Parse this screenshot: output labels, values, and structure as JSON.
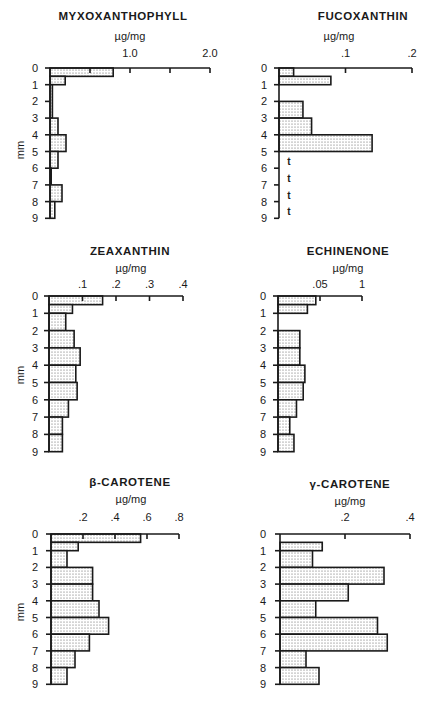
{
  "chart_data": [
    {
      "type": "bar",
      "orientation": "horizontal",
      "title": "MYXOXANTHOPHYLL",
      "xlabel": "µg/mg",
      "ylabel": "mm",
      "xlim": [
        0,
        2.0
      ],
      "x_ticks": [
        0.5,
        1.0,
        1.5,
        2.0
      ],
      "x_tick_labels": [
        {
          "value": 1.0,
          "label": "1.0"
        },
        {
          "value": 2.0,
          "label": "2.0"
        }
      ],
      "y_tick_labels": [
        "0",
        "1",
        "2",
        "3",
        "4",
        "5",
        "6",
        "7",
        "8",
        "9"
      ],
      "ylim": [
        0,
        9
      ],
      "bars": [
        {
          "from": 0,
          "to": 0.5,
          "value": 0.79
        },
        {
          "from": 0.5,
          "to": 1,
          "value": 0.19
        },
        {
          "from": 1,
          "to": 3,
          "value": 0.03
        },
        {
          "from": 3,
          "to": 4,
          "value": 0.1
        },
        {
          "from": 4,
          "to": 5,
          "value": 0.2
        },
        {
          "from": 5,
          "to": 6,
          "value": 0.1
        },
        {
          "from": 6,
          "to": 7,
          "value": 0.01
        },
        {
          "from": 7,
          "to": 8,
          "value": 0.15
        },
        {
          "from": 8,
          "to": 9,
          "value": 0.06
        }
      ],
      "trace": []
    },
    {
      "type": "bar",
      "orientation": "horizontal",
      "title": "FUCOXANTHIN",
      "xlabel": "µg/mg",
      "ylabel": "",
      "xlim": [
        0,
        0.2
      ],
      "x_ticks": [
        0.1,
        0.2
      ],
      "x_tick_labels": [
        {
          "value": 0.1,
          "label": ".1"
        },
        {
          "value": 0.2,
          "label": ".2"
        }
      ],
      "y_tick_labels": [
        "0",
        "1",
        "2",
        "3",
        "4",
        "5",
        "6",
        "7",
        "8",
        "9"
      ],
      "ylim": [
        0,
        9
      ],
      "bars": [
        {
          "from": 0,
          "to": 0.5,
          "value": 0.022
        },
        {
          "from": 0.5,
          "to": 1,
          "value": 0.078
        },
        {
          "from": 2,
          "to": 3,
          "value": 0.036
        },
        {
          "from": 3,
          "to": 4,
          "value": 0.049
        },
        {
          "from": 4,
          "to": 5,
          "value": 0.14
        }
      ],
      "trace": [
        {
          "depth": 6,
          "label": "t"
        },
        {
          "depth": 7,
          "label": "t"
        },
        {
          "depth": 8,
          "label": "t"
        },
        {
          "depth": 9,
          "label": "t"
        }
      ]
    },
    {
      "type": "bar",
      "orientation": "horizontal",
      "title": "ZEAXANTHIN",
      "xlabel": "µg/mg",
      "ylabel": "mm",
      "xlim": [
        0,
        0.4
      ],
      "x_ticks": [
        0.1,
        0.2,
        0.3,
        0.4
      ],
      "x_tick_labels": [
        {
          "value": 0.1,
          "label": ".1"
        },
        {
          "value": 0.2,
          "label": ".2"
        },
        {
          "value": 0.3,
          "label": ".3"
        },
        {
          "value": 0.4,
          "label": ".4"
        }
      ],
      "y_tick_labels": [
        "0",
        "1",
        "2",
        "3",
        "4",
        "5",
        "6",
        "7",
        "8",
        "9"
      ],
      "ylim": [
        0,
        9
      ],
      "bars": [
        {
          "from": 0,
          "to": 0.5,
          "value": 0.16
        },
        {
          "from": 0.5,
          "to": 1,
          "value": 0.07
        },
        {
          "from": 1,
          "to": 2,
          "value": 0.05
        },
        {
          "from": 2,
          "to": 3,
          "value": 0.075
        },
        {
          "from": 3,
          "to": 4,
          "value": 0.093
        },
        {
          "from": 4,
          "to": 5,
          "value": 0.08
        },
        {
          "from": 5,
          "to": 6,
          "value": 0.084
        },
        {
          "from": 6,
          "to": 7,
          "value": 0.058
        },
        {
          "from": 7,
          "to": 8,
          "value": 0.04
        },
        {
          "from": 8,
          "to": 9,
          "value": 0.04
        }
      ],
      "trace": []
    },
    {
      "type": "bar",
      "orientation": "horizontal",
      "title": "ECHINENONE",
      "xlabel": "µg/mg",
      "ylabel": "",
      "xlim": [
        0,
        0.1
      ],
      "x_ticks": [
        0.05,
        0.1
      ],
      "x_tick_labels": [
        {
          "value": 0.05,
          "label": ".05"
        },
        {
          "value": 0.1,
          "label": "1"
        }
      ],
      "y_tick_labels": [
        "0",
        "1",
        "2",
        "3",
        "4",
        "5",
        "6",
        "7",
        "8",
        "9"
      ],
      "ylim": [
        0,
        9
      ],
      "bars": [
        {
          "from": 0,
          "to": 0.5,
          "value": 0.045
        },
        {
          "from": 0.5,
          "to": 1,
          "value": 0.035
        },
        {
          "from": 2,
          "to": 3,
          "value": 0.026
        },
        {
          "from": 3,
          "to": 4,
          "value": 0.026
        },
        {
          "from": 4,
          "to": 5,
          "value": 0.032
        },
        {
          "from": 5,
          "to": 6,
          "value": 0.03
        },
        {
          "from": 6,
          "to": 7,
          "value": 0.022
        },
        {
          "from": 7,
          "to": 8,
          "value": 0.014
        },
        {
          "from": 8,
          "to": 9,
          "value": 0.019
        }
      ],
      "trace": []
    },
    {
      "type": "bar",
      "orientation": "horizontal",
      "title": "β-CAROTENE",
      "xlabel": "µg/mg",
      "ylabel": "mm",
      "xlim": [
        0,
        0.8
      ],
      "x_ticks": [
        0.2,
        0.4,
        0.6,
        0.8
      ],
      "x_tick_labels": [
        {
          "value": 0.2,
          "label": ".2"
        },
        {
          "value": 0.4,
          "label": ".4"
        },
        {
          "value": 0.6,
          "label": ".6"
        },
        {
          "value": 0.8,
          "label": ".8"
        }
      ],
      "y_tick_labels": [
        "0",
        "1",
        "2",
        "3",
        "4",
        "5",
        "6",
        "7",
        "8",
        "9"
      ],
      "ylim": [
        0,
        9
      ],
      "bars": [
        {
          "from": 0,
          "to": 0.5,
          "value": 0.56
        },
        {
          "from": 0.5,
          "to": 1,
          "value": 0.17
        },
        {
          "from": 1,
          "to": 2,
          "value": 0.1
        },
        {
          "from": 2,
          "to": 3,
          "value": 0.26
        },
        {
          "from": 3,
          "to": 4,
          "value": 0.26
        },
        {
          "from": 4,
          "to": 5,
          "value": 0.3
        },
        {
          "from": 5,
          "to": 6,
          "value": 0.36
        },
        {
          "from": 6,
          "to": 7,
          "value": 0.24
        },
        {
          "from": 7,
          "to": 8,
          "value": 0.15
        },
        {
          "from": 8,
          "to": 9,
          "value": 0.1
        }
      ],
      "trace": []
    },
    {
      "type": "bar",
      "orientation": "horizontal",
      "title": "γ-CAROTENE",
      "xlabel": "µg/mg",
      "ylabel": "",
      "xlim": [
        0,
        0.4
      ],
      "x_ticks": [
        0.2,
        0.4
      ],
      "x_tick_labels": [
        {
          "value": 0.2,
          "label": ".2"
        },
        {
          "value": 0.4,
          "label": ".4"
        }
      ],
      "y_tick_labels": [
        "0",
        "1",
        "2",
        "3",
        "4",
        "5",
        "6",
        "7",
        "8",
        "9"
      ],
      "ylim": [
        0,
        9
      ],
      "bars": [
        {
          "from": 0.5,
          "to": 1,
          "value": 0.13
        },
        {
          "from": 1,
          "to": 2,
          "value": 0.1
        },
        {
          "from": 2,
          "to": 3,
          "value": 0.32
        },
        {
          "from": 3,
          "to": 4,
          "value": 0.21
        },
        {
          "from": 4,
          "to": 5,
          "value": 0.11
        },
        {
          "from": 5,
          "to": 6,
          "value": 0.3
        },
        {
          "from": 6,
          "to": 7,
          "value": 0.33
        },
        {
          "from": 7,
          "to": 8,
          "value": 0.08
        },
        {
          "from": 8,
          "to": 9,
          "value": 0.12
        }
      ],
      "trace": []
    }
  ]
}
